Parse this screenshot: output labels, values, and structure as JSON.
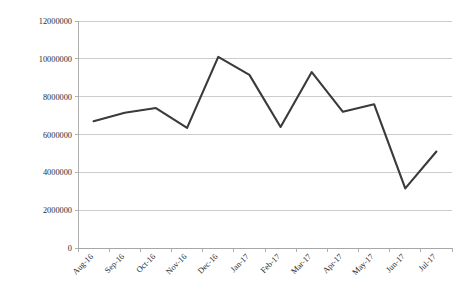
{
  "chart_data": {
    "type": "line",
    "title": "",
    "subtitle": "",
    "xlabel": "",
    "ylabel": "",
    "categories": [
      "Aug-16",
      "Sep-16",
      "Oct-16",
      "Nov-16",
      "Dec-16",
      "Jan-17",
      "Feb-17",
      "Mar-17",
      "Apr-17",
      "May-17",
      "Jun-17",
      "Jul-17"
    ],
    "values": [
      6700000,
      7150000,
      7400000,
      6350000,
      10100000,
      9150000,
      6400000,
      9300000,
      7200000,
      7600000,
      3150000,
      5100000
    ],
    "series": [
      {
        "name": "",
        "color": "#3a3a3a",
        "values": [
          6700000,
          7150000,
          7400000,
          6350000,
          10100000,
          9150000,
          6400000,
          9300000,
          7200000,
          7600000,
          3150000,
          5100000
        ]
      }
    ],
    "ylim": [
      0,
      12000000
    ],
    "ytick_values": [
      0,
      2000000,
      4000000,
      6000000,
      8000000,
      10000000,
      12000000
    ],
    "ytick_labels": [
      "0",
      "2000000",
      "4000000",
      "6000000",
      "8000000",
      "10000000",
      "12000000"
    ],
    "grid": true,
    "grid_axis": "y",
    "legend": false,
    "legend_position": "none",
    "annotations": [],
    "colors": {
      "line": "#3a3a3a",
      "grid": "#bfbfbf",
      "axis": "#a6a6a6",
      "background": "#ffffff",
      "text": "#2b2b2b"
    }
  },
  "plot_geometry": {
    "left": 78,
    "right": 452,
    "top": 21,
    "bottom": 248,
    "xtick_rotation": -45
  }
}
